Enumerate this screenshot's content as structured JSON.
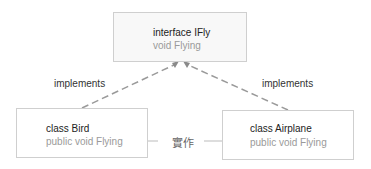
{
  "diagram": {
    "interface": {
      "title": "interface IFly",
      "member": "void Flying"
    },
    "classes": [
      {
        "title": "class Bird",
        "member": "public void Flying"
      },
      {
        "title": "class Airplane",
        "member": "public void Flying"
      }
    ],
    "relations": {
      "left_label": "implements",
      "right_label": "implements",
      "implementation_label": "實作"
    },
    "colors": {
      "border": "#cfcfcf",
      "dashed_line": "#9a9a9a",
      "member_text": "#9a9a9a",
      "title_text": "#222222"
    }
  }
}
